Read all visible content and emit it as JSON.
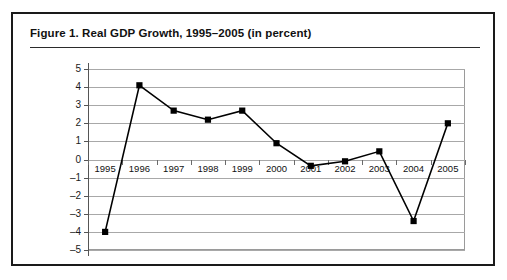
{
  "figure": {
    "title": "Figure 1.  Real GDP Growth, 1995–2005 (in percent)"
  },
  "chart_data": {
    "type": "line",
    "title": "Figure 1.  Real GDP Growth, 1995–2005 (in percent)",
    "xlabel": "",
    "ylabel": "",
    "categories": [
      "1995",
      "1996",
      "1997",
      "1998",
      "1999",
      "2000",
      "2001",
      "2002",
      "2003",
      "2004",
      "2005"
    ],
    "values": [
      -4.0,
      4.1,
      2.7,
      2.2,
      2.7,
      0.9,
      -0.35,
      -0.1,
      0.45,
      -3.4,
      2.0
    ],
    "series": [
      {
        "name": "Real GDP growth",
        "values": [
          -4.0,
          4.1,
          2.7,
          2.2,
          2.7,
          0.9,
          -0.35,
          -0.1,
          0.45,
          -3.4,
          2.0
        ]
      }
    ],
    "ylim": [
      -5,
      5
    ],
    "ytick_labels": [
      "5",
      "4",
      "3",
      "2",
      "1",
      "0",
      "–1",
      "–2",
      "–3",
      "–4",
      "–5"
    ],
    "ytick_values": [
      5,
      4,
      3,
      2,
      1,
      0,
      -1,
      -2,
      -3,
      -4,
      -5
    ],
    "grid": true,
    "legend": false,
    "legend_position": "none",
    "marker": "square",
    "line_color": "#000000",
    "marker_color": "#000000",
    "grid_color": "#a8a8a8"
  }
}
